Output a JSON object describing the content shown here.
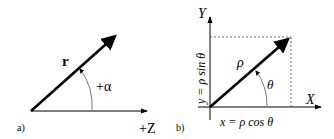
{
  "panel_a": {
    "label": "a)",
    "vector_label": "r",
    "angle_label": "+α",
    "axis_label": "+Z"
  },
  "panel_b": {
    "label": "b)",
    "y_axis_label": "Y",
    "x_axis_label": "X",
    "vector_label": "ρ",
    "angle_label": "θ",
    "x_component": "x = ρ cos θ",
    "y_component": "y = ρ sin θ"
  },
  "colors": {
    "line": "#000000",
    "thin": "#333333",
    "dashed": "#444444",
    "background": "#ffffff"
  }
}
